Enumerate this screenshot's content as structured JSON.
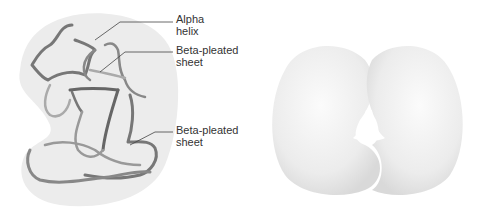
{
  "left_panel": {
    "title": "Protein secondary structure within tertiary fold",
    "labels": [
      {
        "line1": "Alpha",
        "line2": "helix"
      },
      {
        "line1": "Beta-pleated",
        "line2": "sheet"
      },
      {
        "line1": "Beta-pleated",
        "line2": "sheet"
      }
    ]
  },
  "right_panel": {
    "title": "Quaternary space-filling protein shape"
  },
  "colors": {
    "blob": "#ececec",
    "ribbon_dark": "#7a7a7a",
    "ribbon_light": "#a8a8a8",
    "surface": "#f2f2f2"
  }
}
